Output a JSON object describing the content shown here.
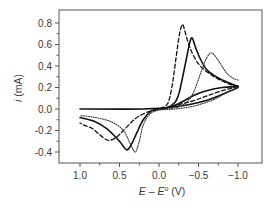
{
  "chart_data": {
    "type": "line",
    "title": "",
    "xlabel": "E – E° (V)",
    "xlabel_parts": {
      "e1": "E",
      "dash": " – ",
      "e2": "E",
      "sup": "o",
      "unit": " (V)"
    },
    "ylabel": "i (mA)",
    "ylabel_parts": {
      "i": "i",
      "unit": " (mA)"
    },
    "xlim": [
      1.27,
      -1.3
    ],
    "ylim": [
      -0.49,
      0.88
    ],
    "x_reversed": true,
    "grid": false,
    "legend": "none",
    "x_ticks": [
      1.0,
      0.5,
      0.0,
      -0.5,
      -1.0
    ],
    "x_tick_labels": [
      "1.0",
      "0.5",
      "0.0",
      "−0.5",
      "−1.0"
    ],
    "x_minor_ticks": [
      0.75,
      0.25,
      -0.25,
      -0.75
    ],
    "y_ticks": [
      0.8,
      0.6,
      0.4,
      0.2,
      0.0,
      -0.2,
      -0.4
    ],
    "y_tick_labels": [
      "0.8",
      "0.6",
      "0.4",
      "0.2",
      "0.0",
      "-0.2",
      "-0.4"
    ],
    "y_minor_ticks": [
      0.7,
      0.5,
      0.3,
      0.1,
      -0.1,
      -0.3
    ],
    "series": [
      {
        "name": "baseline (solid, uncycled)",
        "style": "solid",
        "width": 1.6,
        "points": [
          [
            1.0,
            0.0
          ],
          [
            0.2,
            0.0
          ],
          [
            -0.2,
            0.02
          ],
          [
            -0.6,
            0.08
          ],
          [
            -1.0,
            0.2
          ]
        ]
      },
      {
        "name": "dashed",
        "style": "dashed",
        "width": 1.3,
        "forward": [
          [
            -1.0,
            0.21
          ],
          [
            -0.9,
            0.23
          ],
          [
            -0.8,
            0.26
          ],
          [
            -0.7,
            0.3
          ],
          [
            -0.6,
            0.35
          ],
          [
            -0.5,
            0.42
          ],
          [
            -0.42,
            0.52
          ],
          [
            -0.36,
            0.64
          ],
          [
            -0.31,
            0.77
          ],
          [
            -0.29,
            0.78
          ],
          [
            -0.26,
            0.7
          ],
          [
            -0.22,
            0.5
          ],
          [
            -0.18,
            0.28
          ],
          [
            -0.14,
            0.12
          ],
          [
            -0.1,
            0.04
          ],
          [
            0.0,
            0.0
          ]
        ],
        "reverse": [
          [
            -1.0,
            0.21
          ],
          [
            -0.8,
            0.17
          ],
          [
            -0.6,
            0.12
          ],
          [
            -0.45,
            0.08
          ],
          [
            -0.3,
            0.05
          ],
          [
            -0.15,
            0.02
          ],
          [
            0.0,
            0.0
          ],
          [
            0.15,
            -0.03
          ],
          [
            0.3,
            -0.09
          ],
          [
            0.45,
            -0.2
          ],
          [
            0.55,
            -0.27
          ],
          [
            0.65,
            -0.29
          ],
          [
            0.75,
            -0.24
          ],
          [
            0.85,
            -0.18
          ],
          [
            0.95,
            -0.15
          ],
          [
            1.0,
            -0.13
          ]
        ]
      },
      {
        "name": "solid",
        "style": "solid",
        "width": 1.6,
        "forward": [
          [
            -1.0,
            0.21
          ],
          [
            -0.9,
            0.24
          ],
          [
            -0.8,
            0.27
          ],
          [
            -0.7,
            0.31
          ],
          [
            -0.6,
            0.37
          ],
          [
            -0.52,
            0.47
          ],
          [
            -0.46,
            0.58
          ],
          [
            -0.42,
            0.66
          ],
          [
            -0.39,
            0.62
          ],
          [
            -0.35,
            0.48
          ],
          [
            -0.3,
            0.3
          ],
          [
            -0.25,
            0.14
          ],
          [
            -0.2,
            0.06
          ],
          [
            -0.1,
            0.01
          ],
          [
            0.0,
            0.0
          ]
        ],
        "reverse": [
          [
            -1.0,
            0.21
          ],
          [
            -0.8,
            0.2
          ],
          [
            -0.6,
            0.17
          ],
          [
            -0.45,
            0.13
          ],
          [
            -0.3,
            0.07
          ],
          [
            -0.15,
            0.02
          ],
          [
            0.0,
            0.0
          ],
          [
            0.1,
            -0.02
          ],
          [
            0.2,
            -0.1
          ],
          [
            0.28,
            -0.22
          ],
          [
            0.35,
            -0.33
          ],
          [
            0.41,
            -0.38
          ],
          [
            0.5,
            -0.3
          ],
          [
            0.65,
            -0.19
          ],
          [
            0.8,
            -0.12
          ],
          [
            1.0,
            -0.08
          ]
        ]
      },
      {
        "name": "dotted",
        "style": "dotted",
        "width": 1.1,
        "forward": [
          [
            -1.0,
            0.27
          ],
          [
            -0.93,
            0.29
          ],
          [
            -0.85,
            0.34
          ],
          [
            -0.77,
            0.43
          ],
          [
            -0.67,
            0.52
          ],
          [
            -0.6,
            0.47
          ],
          [
            -0.52,
            0.32
          ],
          [
            -0.44,
            0.16
          ],
          [
            -0.36,
            0.07
          ],
          [
            -0.25,
            0.02
          ],
          [
            -0.1,
            0.0
          ],
          [
            0.0,
            0.0
          ]
        ],
        "reverse": [
          [
            -1.0,
            0.2
          ],
          [
            -0.85,
            0.15
          ],
          [
            -0.7,
            0.09
          ],
          [
            -0.55,
            0.05
          ],
          [
            -0.4,
            0.02
          ],
          [
            -0.2,
            0.0
          ],
          [
            0.0,
            -0.01
          ],
          [
            0.12,
            -0.05
          ],
          [
            0.2,
            -0.15
          ],
          [
            0.25,
            -0.3
          ],
          [
            0.3,
            -0.4
          ],
          [
            0.36,
            -0.33
          ],
          [
            0.45,
            -0.2
          ],
          [
            0.6,
            -0.12
          ],
          [
            0.8,
            -0.08
          ],
          [
            1.0,
            -0.06
          ]
        ]
      }
    ]
  }
}
